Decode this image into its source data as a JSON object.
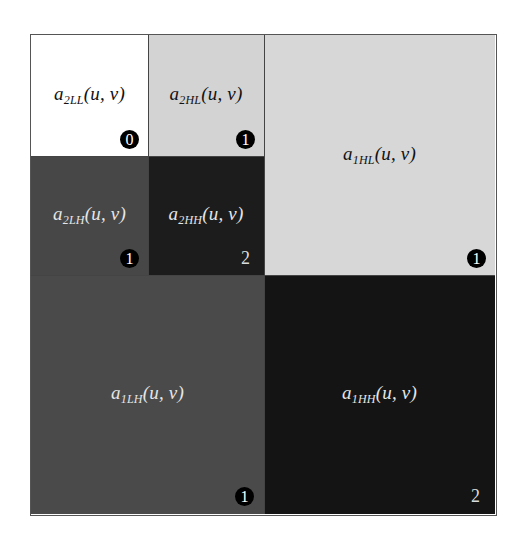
{
  "diagram": {
    "type": "two-level 2D wavelet decomposition subband layout",
    "subbands": [
      {
        "id": "LL2",
        "prefix": "a",
        "level": "2",
        "band": "LL",
        "args": "(u, v)",
        "badge": "0",
        "fill": "#ffffff",
        "tone": "light"
      },
      {
        "id": "HL2",
        "prefix": "a",
        "level": "2",
        "band": "HL",
        "args": "(u, v)",
        "badge": "1",
        "fill": "#d3d3d3",
        "tone": "light"
      },
      {
        "id": "LH2",
        "prefix": "a",
        "level": "2",
        "band": "LH",
        "args": "(u, v)",
        "badge": "1",
        "fill": "#474747",
        "tone": "dark"
      },
      {
        "id": "HH2",
        "prefix": "a",
        "level": "2",
        "band": "HH",
        "args": "(u, v)",
        "badge": "2",
        "fill": "#1c1c1c",
        "tone": "dark"
      },
      {
        "id": "HL1",
        "prefix": "a",
        "level": "1",
        "band": "HL",
        "args": "(u, v)",
        "badge": "1",
        "fill": "#d7d7d7",
        "tone": "light"
      },
      {
        "id": "LH1",
        "prefix": "a",
        "level": "1",
        "band": "LH",
        "args": "(u, v)",
        "badge": "1",
        "fill": "#4a4a4a",
        "tone": "dark"
      },
      {
        "id": "HH1",
        "prefix": "a",
        "level": "1",
        "band": "HH",
        "args": "(u, v)",
        "badge": "2",
        "fill": "#141414",
        "tone": "dark"
      }
    ]
  }
}
